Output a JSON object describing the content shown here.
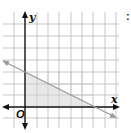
{
  "figure": {
    "type": "coordinate-plane-inequality",
    "x_label": "x",
    "y_label": "y",
    "origin_label": "O",
    "cropped_marker": ":",
    "grid": {
      "x_min": -1,
      "x_max": 8,
      "y_min": -1,
      "y_max": 7,
      "step": 1
    },
    "boundary_line": {
      "slope": -0.5,
      "y_intercept": 3,
      "x_intercept": 6,
      "style": "solid",
      "color": "#9a9a9a"
    },
    "shaded_region": {
      "vertices": [
        [
          0,
          0
        ],
        [
          0,
          3
        ],
        [
          6,
          0
        ]
      ],
      "color": "#e6e6e6"
    },
    "colors": {
      "grid": "#b9b9b9",
      "axes": "#111111",
      "background": "#ffffff"
    }
  }
}
